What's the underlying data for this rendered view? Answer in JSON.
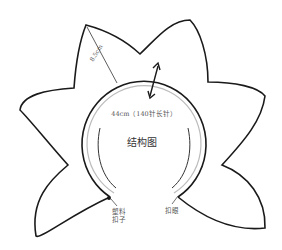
{
  "diagram": {
    "title": "结构图",
    "neck_label": "44cm（140针长针）",
    "radius_label": "8.5cm",
    "left_label_line1": "塑料",
    "left_label_line2": "扣子",
    "right_label": "扣眼"
  },
  "colors": {
    "outline": "#1a1a1a",
    "inner_ring": "#bbbbbb",
    "text": "#555555"
  }
}
